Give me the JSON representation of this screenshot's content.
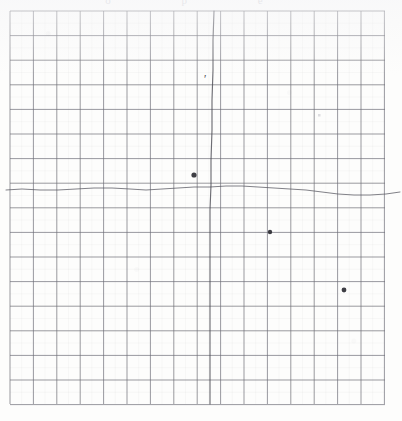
{
  "document": {
    "kind": "scanned-graph-paper",
    "paper_color": "#fdfdfc",
    "grid_line_color": "#6f6f77",
    "grid_minor_color": "#c9c9d0",
    "ink_color": "#4a4a52",
    "top_cut_text": "o p e"
  },
  "chart_data": {
    "type": "line",
    "title": "",
    "subtitle": "",
    "xlabel": "",
    "ylabel": "",
    "grid": true,
    "legend": null,
    "axis": {
      "x_range": [
        0,
        16
      ],
      "y_range": [
        0,
        16
      ],
      "x_ticks": [
        0,
        1,
        2,
        3,
        4,
        5,
        6,
        7,
        8,
        9,
        10,
        11,
        12,
        13,
        14,
        15,
        16
      ],
      "y_ticks": [
        0,
        1,
        2,
        3,
        4,
        5,
        6,
        7,
        8,
        9,
        10,
        11,
        12,
        13,
        14,
        15,
        16
      ],
      "x_tick_labels": [],
      "y_tick_labels": []
    },
    "grid_geometry": {
      "left_px": 10,
      "top_px": 11,
      "right_px": 385,
      "bottom_px": 404,
      "columns": 16,
      "rows": 16,
      "cell_width_px": 23.4,
      "cell_height_px": 24.6
    },
    "series": [
      {
        "name": "horizontal-trace",
        "style": "hand-drawn-line",
        "color": "#595962",
        "points": [
          [
            6,
            190
          ],
          [
            22,
            189
          ],
          [
            40,
            190
          ],
          [
            58,
            190
          ],
          [
            76,
            189
          ],
          [
            94,
            188
          ],
          [
            112,
            188
          ],
          [
            130,
            189
          ],
          [
            146,
            190
          ],
          [
            162,
            189
          ],
          [
            178,
            188
          ],
          [
            194,
            187
          ],
          [
            210,
            187
          ],
          [
            226,
            186
          ],
          [
            242,
            186
          ],
          [
            258,
            187
          ],
          [
            274,
            188
          ],
          [
            290,
            189
          ],
          [
            306,
            190
          ],
          [
            322,
            192
          ],
          [
            338,
            194
          ],
          [
            354,
            195
          ],
          [
            370,
            195
          ],
          [
            386,
            194
          ],
          [
            400,
            192
          ]
        ]
      },
      {
        "name": "vertical-trace",
        "style": "hand-drawn-line",
        "color": "#4a4a52",
        "points": [
          [
            214,
            11
          ],
          [
            213,
            40
          ],
          [
            213,
            70
          ],
          [
            212,
            100
          ],
          [
            212,
            130
          ],
          [
            211,
            160
          ],
          [
            211,
            185
          ],
          [
            210,
            210
          ],
          [
            210,
            240
          ],
          [
            210,
            270
          ],
          [
            210,
            300
          ],
          [
            210,
            330
          ],
          [
            210,
            360
          ],
          [
            210,
            385
          ],
          [
            210,
            404
          ]
        ]
      }
    ],
    "markers": [
      {
        "name": "data-point-1",
        "x_px": 194,
        "y_px": 175,
        "radius_px": 2.6,
        "color": "#2e2e34"
      },
      {
        "name": "data-point-2",
        "x_px": 270,
        "y_px": 232,
        "radius_px": 2.2,
        "color": "#2e2e34"
      },
      {
        "name": "data-point-3",
        "x_px": 344,
        "y_px": 290,
        "radius_px": 2.4,
        "color": "#2e2e34"
      }
    ],
    "annotations": [
      {
        "name": "tick-mark-annotation",
        "text": "'",
        "x_px": 203,
        "y_px": 83,
        "color": "#3a3a42"
      },
      {
        "name": "faint-speck-annotation",
        "text": "",
        "x_px": 318,
        "y_px": 114,
        "color": "#d0d0d6"
      }
    ]
  }
}
